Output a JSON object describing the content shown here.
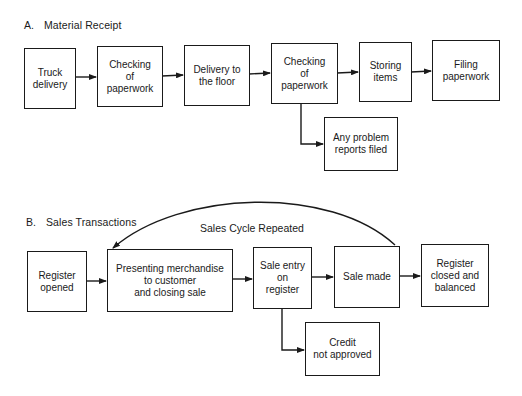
{
  "sections": {
    "a": {
      "letter": "A.",
      "title": "Material Receipt",
      "steps": [
        {
          "id": "truck-delivery",
          "label": "Truck\ndelivery"
        },
        {
          "id": "checking-paperwork-1",
          "label": "Checking\nof\npaperwork"
        },
        {
          "id": "delivery-floor",
          "label": "Delivery to\nthe floor"
        },
        {
          "id": "checking-paperwork-2",
          "label": "Checking\nof\npaperwork"
        },
        {
          "id": "storing-items",
          "label": "Storing\nitems"
        },
        {
          "id": "filing-paperwork",
          "label": "Filing\npaperwork"
        }
      ],
      "branch": {
        "id": "problem-reports",
        "label": "Any problem\nreports filed",
        "from": "checking-paperwork-2"
      }
    },
    "b": {
      "letter": "B.",
      "title": "Sales Transactions",
      "steps": [
        {
          "id": "register-opened",
          "label": "Register\nopened"
        },
        {
          "id": "presenting-merchandise",
          "label": "Presenting merchandise\nto customer\nand closing sale"
        },
        {
          "id": "sale-entry",
          "label": "Sale entry\non\nregister"
        },
        {
          "id": "sale-made",
          "label": "Sale made"
        },
        {
          "id": "register-closed",
          "label": "Register\nclosed and\nbalanced"
        }
      ],
      "branch": {
        "id": "credit-not-approved",
        "label": "Credit\nnot approved",
        "from": "sale-entry"
      },
      "loop": {
        "label": "Sales Cycle Repeated",
        "from": "sale-made",
        "to": "presenting-merchandise"
      }
    }
  },
  "colors": {
    "line": "#1a1a1a",
    "background": "#ffffff"
  }
}
